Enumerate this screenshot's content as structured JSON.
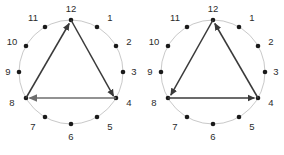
{
  "figure": {
    "name": "modular-arithmetic-clock-pair",
    "panel_count": 2,
    "colors": {
      "background": "#ffffff",
      "circle_stroke": "#c9c9c9",
      "dot_fill": "#1a1a1a",
      "label_fill": "#2b2b2b",
      "arrow_diagonal": "#3a3a3a",
      "arrow_horizontal": "#6e6e6e"
    },
    "hour_labels": [
      "12",
      "1",
      "2",
      "3",
      "4",
      "5",
      "6",
      "7",
      "8",
      "9",
      "10",
      "11"
    ],
    "marked_hours": [
      "12",
      "4",
      "8"
    ]
  },
  "panels": [
    {
      "id": "left-clock",
      "name": "clock-diagram-clockwise",
      "direction": "clockwise",
      "vertices": [
        "12",
        "4",
        "8"
      ],
      "edges": [
        {
          "from": "12",
          "to": "4",
          "arrow_at": "4",
          "style": "diagonal"
        },
        {
          "from": "4",
          "to": "8",
          "arrow_at": "8",
          "style": "horizontal"
        },
        {
          "from": "8",
          "to": "12",
          "arrow_at": "12",
          "style": "diagonal"
        }
      ]
    },
    {
      "id": "right-clock",
      "name": "clock-diagram-counterclockwise",
      "direction": "counterclockwise",
      "vertices": [
        "12",
        "8",
        "4"
      ],
      "edges": [
        {
          "from": "12",
          "to": "8",
          "arrow_at": "8",
          "style": "diagonal"
        },
        {
          "from": "8",
          "to": "4",
          "arrow_at": "4",
          "style": "horizontal"
        },
        {
          "from": "4",
          "to": "12",
          "arrow_at": "12",
          "style": "diagonal"
        }
      ]
    }
  ],
  "hours": {
    "h12": "12",
    "h1": "1",
    "h2": "2",
    "h3": "3",
    "h4": "4",
    "h5": "5",
    "h6": "6",
    "h7": "7",
    "h8": "8",
    "h9": "9",
    "h10": "10",
    "h11": "11"
  }
}
